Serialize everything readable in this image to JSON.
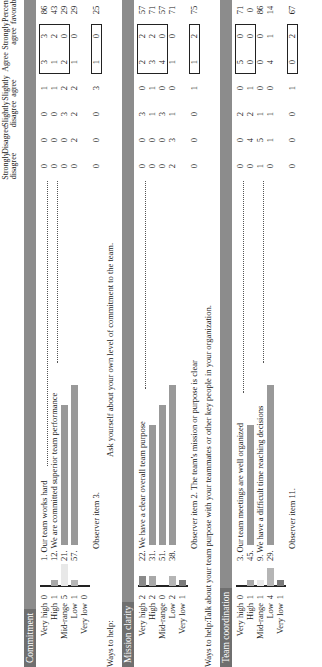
{
  "columns": [
    "Strongly disagree",
    "Disagree",
    "Slightly disagree",
    "Slightly agree",
    "Agree",
    "Strongly agree",
    "Percent favorable"
  ],
  "distribution_labels": [
    "Very high",
    "High",
    "Mid-range",
    "Low",
    "Very low"
  ],
  "colors": {
    "header_bar": "#8c8c8c",
    "title_bg": "#6f6f6f",
    "very_high": "#8a8a8a",
    "high": "#a8a8a8",
    "mid_range": "#e8e8e8",
    "low": "#b5b5b5",
    "very_low": "#7a7a7a",
    "item_bar": "#999999"
  },
  "sections": [
    {
      "title": "Commitment",
      "distribution": [
        0,
        1,
        5,
        1,
        0
      ],
      "items": [
        {
          "label": "1. Our team works hard",
          "values": [
            0,
            0,
            0,
            1,
            3,
            3
          ],
          "favorable": "86"
        },
        {
          "label": "12. We are committed superior team performance",
          "values": [
            0,
            0,
            0,
            1,
            1,
            2
          ],
          "favorable": "43"
        },
        {
          "label": "21.",
          "values": [
            0,
            0,
            3,
            2,
            2,
            0
          ],
          "favorable": "29"
        },
        {
          "label": "57.",
          "values": [
            0,
            2,
            2,
            2,
            1,
            0
          ],
          "favorable": "29"
        }
      ],
      "observer": {
        "label": "Observer item 3.",
        "values": [
          0,
          0,
          0,
          3,
          1,
          0
        ],
        "favorable": "25"
      },
      "ways_to_help": {
        "prefix": "Ways to help:",
        "text": "Ask yourself about your own level of commitment to the team."
      }
    },
    {
      "title": "Mission clarity",
      "distribution": [
        2,
        2,
        0,
        2,
        1
      ],
      "items": [
        {
          "label": "22. We have a clear overall team purpose",
          "values": [
            0,
            0,
            3,
            0,
            2,
            2
          ],
          "favorable": "57"
        },
        {
          "label": "31.",
          "values": [
            0,
            0,
            1,
            1,
            3,
            2
          ],
          "favorable": "71"
        },
        {
          "label": "51.",
          "values": [
            0,
            0,
            3,
            0,
            4,
            0
          ],
          "favorable": "57"
        },
        {
          "label": "38.",
          "values": [
            2,
            3,
            1,
            0,
            1,
            0
          ],
          "favorable": "71"
        }
      ],
      "observer": {
        "label": "Observer item 2. The team's mission or purpose is clear",
        "values": [
          0,
          0,
          0,
          1,
          1,
          2
        ],
        "favorable": "75"
      },
      "ways_to_help": {
        "prefix": "Ways to help:",
        "text": "Talk about your team purpose with your teammates or other key people in your organization."
      }
    },
    {
      "title": "Team coordination",
      "distribution": [
        0,
        1,
        1,
        4,
        1
      ],
      "items": [
        {
          "label": "3. Our team meetings are well organized",
          "values": [
            0,
            0,
            2,
            0,
            5,
            0
          ],
          "favorable": "71"
        },
        {
          "label": "45.",
          "values": [
            0,
            4,
            2,
            1,
            0,
            0
          ],
          "favorable": "0"
        },
        {
          "label": "9. We have a difficult time reaching decisions",
          "values": [
            1,
            5,
            1,
            0,
            0,
            0
          ],
          "favorable": "86"
        },
        {
          "label": "29.",
          "values": [
            0,
            1,
            1,
            0,
            4,
            1
          ],
          "favorable": "14"
        }
      ],
      "observer": {
        "label": "Observer item 11.",
        "values": [
          0,
          0,
          0,
          1,
          0,
          2
        ],
        "favorable": "67"
      }
    }
  ]
}
